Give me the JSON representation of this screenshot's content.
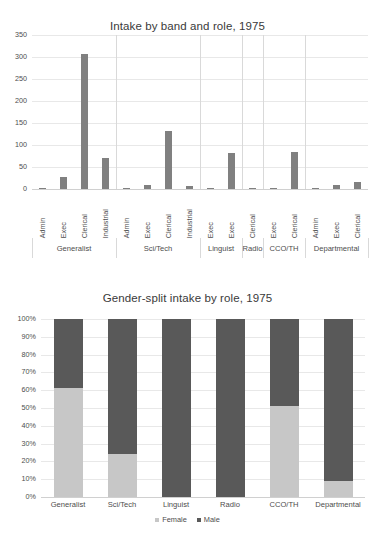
{
  "chart_data": [
    {
      "type": "bar",
      "title": "Intake by band and role, 1975",
      "xlabel": "",
      "ylabel": "",
      "ylim": [
        0,
        350
      ],
      "yticks": [
        "0",
        "50",
        "100",
        "150",
        "200",
        "250",
        "300",
        "350"
      ],
      "ytick_values": [
        0,
        50,
        100,
        150,
        200,
        250,
        300,
        350
      ],
      "grid": true,
      "legend": "none",
      "bar_color": "#808080",
      "categories": [
        "Admin",
        "Exec",
        "Clerical",
        "Industrial",
        "Admin",
        "Exec",
        "Clerical",
        "Industrial",
        "Exec",
        "Exec",
        "Clerical",
        "Exec",
        "Clerical",
        "Admin",
        "Exec",
        "Clerical"
      ],
      "values": [
        1,
        28,
        307,
        70,
        1,
        10,
        131,
        7,
        1,
        81,
        3,
        1,
        85,
        2,
        10,
        16
      ],
      "groups": [
        {
          "label": "Generalist",
          "span": 4
        },
        {
          "label": "Sci/Tech",
          "span": 4
        },
        {
          "label": "Linguist",
          "span": 2
        },
        {
          "label": "Radio",
          "span": 1
        },
        {
          "label": "CCO/TH",
          "span": 2
        },
        {
          "label": "Departmental",
          "span": 3
        }
      ]
    },
    {
      "type": "bar",
      "subtype": "stacked-100",
      "title": "Gender-split intake by role, 1975",
      "xlabel": "",
      "ylabel": "",
      "ylim": [
        0,
        100
      ],
      "yticks": [
        "0%",
        "10%",
        "20%",
        "30%",
        "40%",
        "50%",
        "60%",
        "70%",
        "80%",
        "90%",
        "100%"
      ],
      "ytick_values": [
        0,
        10,
        20,
        30,
        40,
        50,
        60,
        70,
        80,
        90,
        100
      ],
      "grid": true,
      "legend_position": "bottom",
      "categories": [
        "Generalist",
        "Sci/Tech",
        "Linguist",
        "Radio",
        "CCO/TH",
        "Departmental"
      ],
      "series": [
        {
          "name": "Female",
          "color": "#c7c7c7",
          "values": [
            61,
            24,
            0,
            0,
            51,
            9
          ]
        },
        {
          "name": "Male",
          "color": "#595959",
          "values": [
            39,
            76,
            100,
            100,
            49,
            91
          ]
        }
      ]
    }
  ]
}
